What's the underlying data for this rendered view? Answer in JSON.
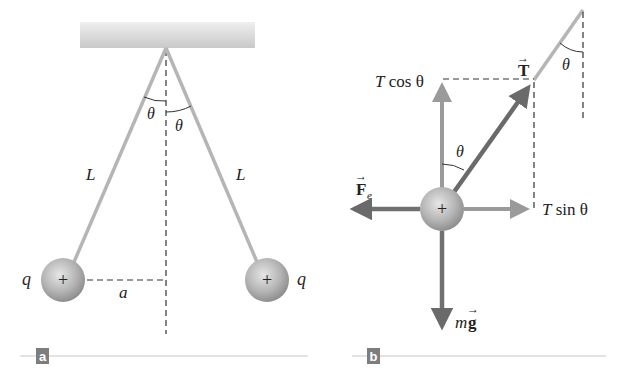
{
  "figure": {
    "panel_a": {
      "badge": "a",
      "labels": {
        "theta_left": "θ",
        "theta_right": "θ",
        "length_left": "L",
        "length_right": "L",
        "charge_left": "q",
        "charge_right": "q",
        "separation": "a",
        "sphere_sign_left": "+",
        "sphere_sign_right": "+"
      }
    },
    "panel_b": {
      "badge": "b",
      "labels": {
        "tension": "T",
        "tension_arrow": "→",
        "t_cos": "T cos θ",
        "t_cos_T": "T",
        "t_cos_rest": " cos θ",
        "t_sin_T": "T",
        "t_sin_rest": " sin θ",
        "electric_force": "F",
        "electric_force_sub": "e",
        "electric_force_arrow": "→",
        "weight_m": "m",
        "weight_g": "g",
        "weight_arrow": "→",
        "theta_center": "θ",
        "theta_top": "θ",
        "sphere_sign": "+"
      }
    },
    "colors": {
      "string": "#b5b5b5",
      "tension_arrow": "#6a6a6a",
      "component_arrow": "#9a9a9a",
      "force_arrow": "#707070",
      "sphere_light": "#e2e2e2",
      "sphere_dark": "#8f8f8f",
      "badge": "#7d7d7d",
      "baseline": "#c8c8c8"
    }
  }
}
